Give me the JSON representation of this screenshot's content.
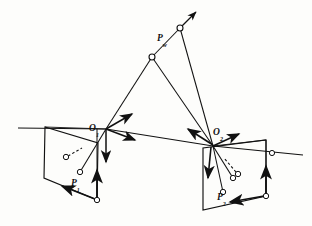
{
  "figure": {
    "kind": "stereo-vision-epipolar-geometry-diagram",
    "background_color": "#fdfdfb",
    "stroke_color": "#111111"
  },
  "labels": {
    "world_point": {
      "base": "P",
      "sub": "w"
    },
    "left_center": {
      "base": "O",
      "sub": "1"
    },
    "right_center": {
      "base": "O",
      "sub": "2"
    },
    "left_image_point": {
      "base": "P",
      "sub": "1"
    },
    "right_image_point": {
      "base": "P",
      "sub": "2"
    }
  },
  "geometry": {
    "left_camera": {
      "center": [
        106,
        129
      ],
      "image_plane": [
        [
          45,
          127
        ],
        [
          44,
          178
        ],
        [
          97,
          200
        ],
        [
          98,
          143
        ]
      ],
      "image_point": [
        80,
        172
      ],
      "aux_point": [
        66,
        157
      ],
      "axes": [
        {
          "name": "x-axis-arrow",
          "to": [
            133,
            113
          ]
        },
        {
          "name": "y-axis-arrow",
          "to": [
            136,
            139
          ]
        },
        {
          "name": "z-axis-arrow",
          "to": [
            106,
            165
          ]
        }
      ]
    },
    "right_camera": {
      "center": [
        213,
        146
      ],
      "image_plane": [
        [
          203,
          148
        ],
        [
          203,
          210
        ],
        [
          266,
          196
        ],
        [
          266,
          140
        ]
      ],
      "image_point": [
        223,
        192
      ],
      "aux_point": [
        238,
        174
      ],
      "axes": [
        {
          "name": "x-axis-arrow",
          "to": [
            240,
            133
          ]
        },
        {
          "name": "y-axis-arrow",
          "to": [
            186,
            128
          ]
        },
        {
          "name": "z-axis-arrow",
          "to": [
            209,
            181
          ]
        }
      ]
    },
    "world_point_node": [
      180,
      28
    ],
    "mid_node": [
      152,
      57
    ],
    "ray_arrow_tip": [
      196,
      9
    ],
    "epipolar_line": {
      "from": [
        18,
        128
      ],
      "to": [
        303,
        155
      ]
    },
    "right_line_node": [
      272,
      153
    ]
  }
}
